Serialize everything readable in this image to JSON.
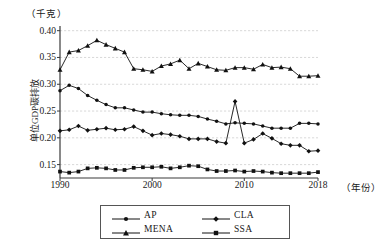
{
  "chart_data": {
    "type": "line",
    "title": "",
    "unit_label": "（千克）",
    "ylabel": "单位GDP碳排放",
    "xlabel": "（年份）",
    "ylim": [
      0.125,
      0.405
    ],
    "xlim": [
      1990,
      2018
    ],
    "grid": true,
    "grid_axis": "y",
    "legend_position": "bottom",
    "ytick_labels": [
      "0.40",
      "0.35",
      "0.30",
      "0.25",
      "0.20",
      "0.15"
    ],
    "ytick_values": [
      0.4,
      0.35,
      0.3,
      0.25,
      0.2,
      0.15
    ],
    "xtick_labels": [
      "1990",
      "2000",
      "2010",
      "2018"
    ],
    "xtick_values": [
      1990,
      2000,
      2010,
      2018
    ],
    "x": [
      1990,
      1991,
      1992,
      1993,
      1994,
      1995,
      1996,
      1997,
      1998,
      1999,
      2000,
      2001,
      2002,
      2003,
      2004,
      2005,
      2006,
      2007,
      2008,
      2009,
      2010,
      2011,
      2012,
      2013,
      2014,
      2015,
      2016,
      2017,
      2018
    ],
    "series": [
      {
        "name": "AP",
        "marker": "circle",
        "color": "#111111",
        "values": [
          0.288,
          0.298,
          0.292,
          0.279,
          0.27,
          0.262,
          0.256,
          0.256,
          0.252,
          0.248,
          0.248,
          0.245,
          0.243,
          0.242,
          0.242,
          0.24,
          0.235,
          0.231,
          0.226,
          0.228,
          0.227,
          0.226,
          0.222,
          0.218,
          0.218,
          0.218,
          0.227,
          0.227,
          0.226
        ]
      },
      {
        "name": "CLA",
        "marker": "diamond",
        "color": "#111111",
        "values": [
          0.213,
          0.215,
          0.222,
          0.214,
          0.216,
          0.218,
          0.215,
          0.216,
          0.221,
          0.213,
          0.205,
          0.208,
          0.206,
          0.203,
          0.198,
          0.198,
          0.198,
          0.193,
          0.19,
          0.268,
          0.19,
          0.197,
          0.208,
          0.199,
          0.189,
          0.186,
          0.186,
          0.175,
          0.176
        ]
      },
      {
        "name": "MENA",
        "marker": "triangle",
        "color": "#111111",
        "values": [
          0.327,
          0.36,
          0.363,
          0.372,
          0.382,
          0.374,
          0.367,
          0.36,
          0.329,
          0.327,
          0.324,
          0.334,
          0.338,
          0.345,
          0.329,
          0.339,
          0.333,
          0.327,
          0.326,
          0.331,
          0.331,
          0.328,
          0.337,
          0.331,
          0.332,
          0.329,
          0.315,
          0.315,
          0.316
        ]
      },
      {
        "name": "SSA",
        "marker": "square",
        "color": "#111111",
        "values": [
          0.137,
          0.135,
          0.137,
          0.143,
          0.144,
          0.143,
          0.14,
          0.14,
          0.144,
          0.145,
          0.145,
          0.146,
          0.143,
          0.145,
          0.148,
          0.147,
          0.141,
          0.138,
          0.138,
          0.139,
          0.137,
          0.138,
          0.137,
          0.135,
          0.134,
          0.134,
          0.134,
          0.134,
          0.136
        ]
      }
    ]
  },
  "legend": {
    "items": [
      {
        "label": "AP",
        "marker": "circle"
      },
      {
        "label": "CLA",
        "marker": "diamond"
      },
      {
        "label": "MENA",
        "marker": "triangle"
      },
      {
        "label": "SSA",
        "marker": "square"
      }
    ]
  }
}
